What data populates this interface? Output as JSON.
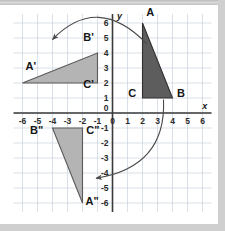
{
  "figure": {
    "background_color": "#ffffff",
    "frame_color": "#cfcfcf"
  },
  "chart_data": {
    "type": "scatter",
    "title": "",
    "xlabel": "x",
    "ylabel": "y",
    "xlim": [
      -6.6,
      6.6
    ],
    "ylim": [
      -6.6,
      6.6
    ],
    "grid": true,
    "grid_step": 1,
    "grid_color": "#c9d2dd",
    "axis_color": "#3a3a3a",
    "xticks": [
      -6,
      -5,
      -4,
      -3,
      -2,
      -1,
      0,
      1,
      2,
      3,
      4,
      5,
      6
    ],
    "xtick_labels": [
      "-6",
      "-5",
      "-4",
      "-3",
      "-2",
      "-1",
      "0",
      "1",
      "2",
      "3",
      "4",
      "5",
      "6"
    ],
    "yticks": [
      -6,
      -5,
      -4,
      -3,
      -2,
      -1,
      0,
      1,
      2,
      3,
      4,
      5,
      6
    ],
    "ytick_labels": [
      "-6",
      "-5",
      "-4",
      "-3",
      "-2",
      "-1",
      "0",
      "1",
      "2",
      "3",
      "4",
      "5",
      "6"
    ],
    "origin_label": "0",
    "shapes": [
      {
        "name": "triangle-abc",
        "fill": "#5d5d5d",
        "stroke": "#303030",
        "vertices": [
          {
            "label": "A",
            "x": 2,
            "y": 6,
            "label_dx": 0.25,
            "label_dy": 0.45
          },
          {
            "label": "B",
            "x": 4,
            "y": 1,
            "label_dx": 0.3,
            "label_dy": 0.1
          },
          {
            "label": "C",
            "x": 2,
            "y": 1,
            "label_dx": -0.95,
            "label_dy": 0.1
          }
        ]
      },
      {
        "name": "triangle-a-prime-b-prime-c-prime",
        "fill": "#b4b4b4",
        "stroke": "#5a5a5a",
        "vertices": [
          {
            "label": "A'",
            "x": -6,
            "y": 2,
            "label_dx": 0.2,
            "label_dy": 0.85
          },
          {
            "label": "B'",
            "x": -1,
            "y": 4,
            "label_dx": -0.95,
            "label_dy": 0.8
          },
          {
            "label": "C'",
            "x": -1,
            "y": 2,
            "label_dx": -0.95,
            "label_dy": -0.35
          }
        ]
      },
      {
        "name": "triangle-a-double-prime-b-double-prime-c-double-prime",
        "fill": "#b4b4b4",
        "stroke": "#5a5a5a",
        "vertices": [
          {
            "label": "A\"",
            "x": -2,
            "y": -6,
            "label_dx": 0.2,
            "label_dy": -0.1
          },
          {
            "label": "B\"",
            "x": -4,
            "y": -1,
            "label_dx": -1.5,
            "label_dy": -0.4
          },
          {
            "label": "C\"",
            "x": -2,
            "y": -1,
            "label_dx": 0.25,
            "label_dy": -0.4
          }
        ]
      }
    ],
    "annotations": [
      {
        "name": "rotation-arrow-top",
        "kind": "curved-arrow",
        "from": {
          "x": 2.3,
          "y": 4.6
        },
        "to": {
          "x": -4.0,
          "y": 4.9
        },
        "control": {
          "x": -1.0,
          "y": 8.0
        },
        "color": "#4a4a4a"
      },
      {
        "name": "rotation-arrow-bottom",
        "kind": "curved-arrow",
        "from": {
          "x": 3.4,
          "y": 0.9
        },
        "to": {
          "x": -1.1,
          "y": -4.35
        },
        "control": {
          "x": 3.6,
          "y": -3.6
        },
        "color": "#4a4a4a"
      }
    ]
  }
}
